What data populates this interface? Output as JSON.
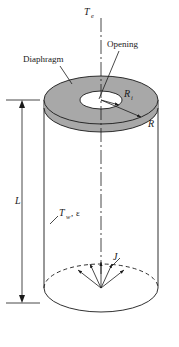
{
  "figure": {
    "labels": {
      "emission_temperature": "T",
      "emission_temperature_sub": "e",
      "diaphragm": "Diaphragm",
      "opening": "Opening",
      "inner_radius": "R",
      "inner_radius_sub": "i",
      "outer_radius": "R",
      "length": "L",
      "wall_temperature": "T",
      "wall_temperature_sub": "w",
      "wall_comma": ",",
      "emissivity": "ε",
      "radiosity": "J"
    },
    "colors": {
      "diaphragm_fill": "#a8a8a8",
      "cylinder_fill": "#ffffff",
      "line": "#1a1a1a",
      "opening_fill": "#ffffff"
    },
    "geometry": {
      "cylinder_left_x": 44,
      "cylinder_right_x": 158,
      "cylinder_top_y": 100,
      "cylinder_bottom_y": 312,
      "disk_center_x": 101,
      "disk_center_y": 100,
      "disk_rx": 57,
      "disk_ry": 24,
      "opening_rx": 21,
      "opening_ry": 9,
      "dimension_line_x": 22,
      "dimension_top_y": 100,
      "dimension_bottom_y": 303
    }
  }
}
